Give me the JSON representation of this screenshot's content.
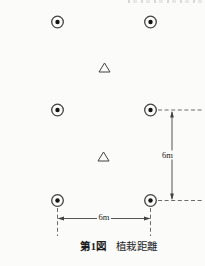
{
  "figure": {
    "caption": {
      "figure_no": "第1図",
      "title": "植栽距離"
    },
    "colors": {
      "background": "#fbfbfa",
      "line": "#424242",
      "dashed_line": "#5a5a5a",
      "symbol_dot": "#141414",
      "text": "#1d1d1d"
    }
  },
  "diagram_data": {
    "type": "planting-layout-diagram",
    "tree_symbol_count": 6,
    "triangle_count": 2,
    "trees": [
      {
        "x": 57.5,
        "y": 22
      },
      {
        "x": 150.5,
        "y": 22
      },
      {
        "x": 57.5,
        "y": 110
      },
      {
        "x": 150.5,
        "y": 110
      },
      {
        "x": 57.5,
        "y": 200.5
      },
      {
        "x": 150.5,
        "y": 200.5
      }
    ],
    "triangles": [
      {
        "x": 104.5,
        "y": 67.5
      },
      {
        "x": 103.5,
        "y": 156.5
      }
    ],
    "extension_lines": [
      {
        "x1": 158,
        "y1": 110,
        "x2": 203,
        "y2": 110
      },
      {
        "x1": 158,
        "y1": 200.5,
        "x2": 203,
        "y2": 200.5
      },
      {
        "x1": 57.5,
        "y1": 208,
        "x2": 57.5,
        "y2": 236
      },
      {
        "x1": 150.5,
        "y1": 208,
        "x2": 150.5,
        "y2": 236
      }
    ],
    "dimensions": [
      {
        "label": "6m",
        "orientation": "vertical",
        "x1": 172,
        "y1": 112,
        "x2": 172,
        "y2": 199,
        "label_x": 167.5,
        "label_y": 155
      },
      {
        "label": "6m",
        "orientation": "horizontal",
        "x1": 58.5,
        "y1": 218.5,
        "x2": 149.5,
        "y2": 218.5,
        "label_x": 104,
        "label_y": 217
      }
    ]
  }
}
